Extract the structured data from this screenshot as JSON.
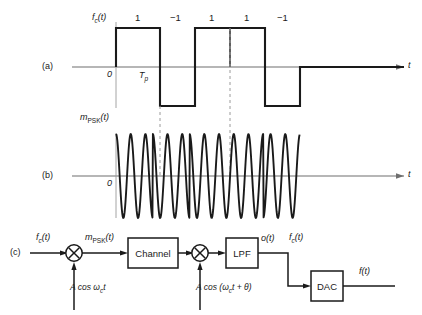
{
  "figure": {
    "panels": [
      "(a)",
      "(b)",
      "(c)"
    ],
    "colors": {
      "ink": "#1a1a1a",
      "axis": "#6e6e6e",
      "dashed": "#9a9a9a"
    }
  },
  "panel_a": {
    "tag": "(a)",
    "signal_label_main": "f",
    "signal_label_sub": "c",
    "signal_label_tail": "(t)",
    "origin_label": "0",
    "period_label_main": "T",
    "period_label_sub": "p",
    "axis_label": "t",
    "bit_labels": [
      "1",
      "−1",
      "1",
      "1",
      "−1"
    ]
  },
  "panel_b": {
    "tag": "(b)",
    "signal_label_main": "m",
    "signal_label_sub": "PSK",
    "signal_label_tail": "(t)",
    "origin_label": "0",
    "axis_label": "t"
  },
  "panel_c": {
    "tag": "(c)",
    "input_label_main": "f",
    "input_label_sub": "c",
    "input_label_tail": "(t)",
    "mod_out_label_main": "m",
    "mod_out_label_sub": "PSK",
    "mod_out_label_tail": "(t)",
    "channel_block": "Channel",
    "lpf_block": "LPF",
    "dac_block": "DAC",
    "lpf_out_label": "o(t)",
    "recovered_label_main": "f",
    "recovered_label_sub": "c",
    "recovered_label_tail": "(t)",
    "final_out_label": "f(t)",
    "carrier_tx_main": "A cos ",
    "carrier_tx_omega": "ω",
    "carrier_tx_sub": "c",
    "carrier_tx_tail": "t",
    "carrier_rx_main": "A cos (",
    "carrier_rx_omega": "ω",
    "carrier_rx_sub": "c",
    "carrier_rx_tail": "t + θ)",
    "multiplier_glyph": "×"
  },
  "chart_data": {
    "type": "line",
    "xlabel": "t",
    "ylabel": "",
    "panels": [
      {
        "name": "(a) f_c(t) binary data signal",
        "type": "square",
        "bit_values": [
          1,
          -1,
          1,
          1,
          -1
        ],
        "bit_count": 5,
        "bit_period_label": "T_p",
        "x_starts": [
          116,
          160,
          195,
          230,
          265
        ],
        "x_ends": [
          160,
          195,
          230,
          265,
          300
        ],
        "amplitude_levels": [
          1,
          -1
        ],
        "origin_x": 116,
        "ylim": [
          -1.3,
          1.3
        ],
        "grid": false
      },
      {
        "name": "(b) m_PSK(t) phase shift keyed carrier",
        "type": "sinusoid",
        "description": "Carrier A cos(wc t) with 180 degree phase reversal at each bit sign change",
        "cycles_per_bit": 2.5,
        "phase_per_bit_deg": [
          0,
          180,
          0,
          0,
          180
        ],
        "origin_x": 116,
        "x_start": 116,
        "x_end": 300,
        "ylim": [
          -1.15,
          1.15
        ],
        "grid": false
      }
    ],
    "legend": "none"
  }
}
